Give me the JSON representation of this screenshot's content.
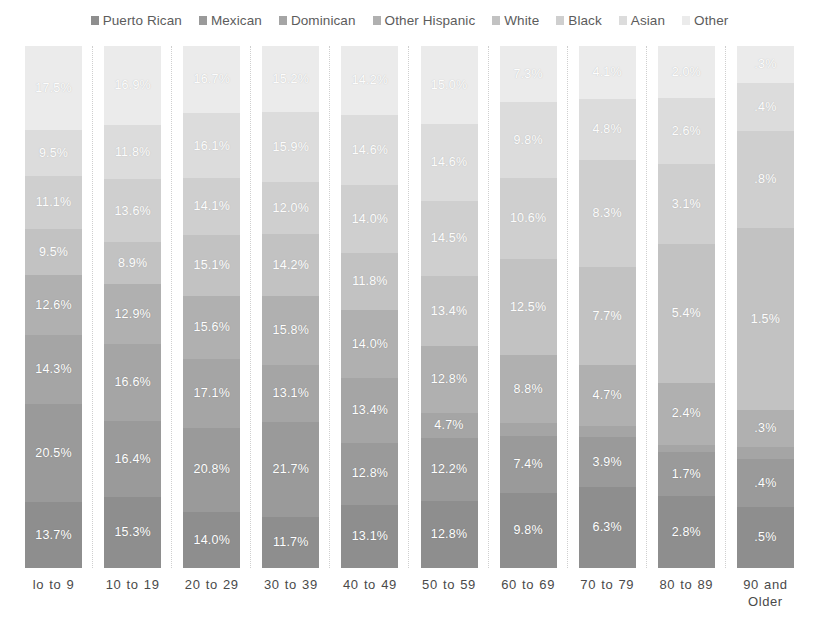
{
  "legend": {
    "position": "top",
    "items": [
      {
        "label": "Puerto Rican",
        "color": "#8e8e8e"
      },
      {
        "label": "Mexican",
        "color": "#9a9a9a"
      },
      {
        "label": "Dominican",
        "color": "#a5a5a5"
      },
      {
        "label": "Other Hispanic",
        "color": "#b0b0b0"
      },
      {
        "label": "White",
        "color": "#c2c2c2"
      },
      {
        "label": "Black",
        "color": "#cfcfcf"
      },
      {
        "label": "Asian",
        "color": "#dcdcdc"
      },
      {
        "label": "Other",
        "color": "#ebebeb"
      }
    ]
  },
  "chart_data": {
    "type": "bar",
    "subtype": "100% stacked column",
    "title": "",
    "xlabel": "",
    "ylabel": "",
    "ylim": [
      0,
      100
    ],
    "grid": true,
    "categories": [
      "lo to 9",
      "10 to 19",
      "20 to 29",
      "30 to 39",
      "40 to 49",
      "50 to 59",
      "60 to 69",
      "70 to 79",
      "80 to 89",
      "90 and Older"
    ],
    "series": [
      {
        "name": "Puerto Rican",
        "color": "#8e8e8e",
        "values": [
          13.7,
          15.3,
          14.0,
          11.7,
          13.1,
          12.8,
          9.8,
          6.3,
          2.8,
          0.5
        ],
        "labels": [
          "13.7%",
          "15.3%",
          "14.0%",
          "11.7%",
          "13.1%",
          "12.8%",
          "9.8%",
          "6.3%",
          "2.8%",
          ".5%"
        ]
      },
      {
        "name": "Mexican",
        "color": "#9a9a9a",
        "values": [
          20.5,
          16.4,
          20.8,
          21.7,
          12.8,
          12.2,
          7.4,
          3.9,
          1.7,
          0.4
        ],
        "labels": [
          "20.5%",
          "16.4%",
          "20.8%",
          "21.7%",
          "12.8%",
          "12.2%",
          "7.4%",
          "3.9%",
          "1.7%",
          ".4%"
        ]
      },
      {
        "name": "Dominican",
        "color": "#a5a5a5",
        "values": [
          14.3,
          16.6,
          17.1,
          13.1,
          13.4,
          4.7,
          1.7,
          0.9,
          0.3,
          0.1
        ],
        "labels": [
          "14.3%",
          "16.6%",
          "17.1%",
          "13.1%",
          "13.4%",
          "4.7%",
          "1.7%",
          ".9%",
          ".3%",
          ".1%"
        ]
      },
      {
        "name": "Other Hispanic",
        "color": "#b0b0b0",
        "values": [
          12.6,
          12.9,
          15.6,
          15.8,
          14.0,
          12.8,
          8.8,
          4.7,
          2.4,
          0.3
        ],
        "labels": [
          "12.6%",
          "12.9%",
          "15.6%",
          "15.8%",
          "14.0%",
          "12.8%",
          "8.8%",
          "4.7%",
          "2.4%",
          ".3%"
        ]
      },
      {
        "name": "White",
        "color": "#c2c2c2",
        "values": [
          9.5,
          8.9,
          15.1,
          14.2,
          11.8,
          13.4,
          12.5,
          7.7,
          5.4,
          1.5
        ],
        "labels": [
          "9.5%",
          "8.9%",
          "15.1%",
          "14.2%",
          "11.8%",
          "13.4%",
          "12.5%",
          "7.7%",
          "5.4%",
          "1.5%"
        ]
      },
      {
        "name": "Black",
        "color": "#cfcfcf",
        "values": [
          11.1,
          13.6,
          14.1,
          12.0,
          14.0,
          14.5,
          10.6,
          8.3,
          3.1,
          0.8
        ],
        "labels": [
          "11.1%",
          "13.6%",
          "14.1%",
          "12.0%",
          "14.0%",
          "14.5%",
          "10.6%",
          "8.3%",
          "3.1%",
          ".8%"
        ]
      },
      {
        "name": "Asian",
        "color": "#dcdcdc",
        "values": [
          9.5,
          11.8,
          16.1,
          15.9,
          14.6,
          14.6,
          9.8,
          4.8,
          2.6,
          0.4
        ],
        "labels": [
          "9.5%",
          "11.8%",
          "16.1%",
          "15.9%",
          "14.6%",
          "14.6%",
          "9.8%",
          "4.8%",
          "2.6%",
          ".4%"
        ]
      },
      {
        "name": "Other",
        "color": "#ebebeb",
        "values": [
          17.5,
          16.9,
          16.7,
          15.2,
          14.2,
          15.0,
          7.3,
          4.1,
          2.0,
          0.3
        ],
        "labels": [
          "17.5%",
          "16.9%",
          "16.7%",
          "15.2%",
          "14.2%",
          "15.0%",
          "7.3%",
          "4.1%",
          "2.0%",
          ".3%"
        ]
      }
    ]
  }
}
